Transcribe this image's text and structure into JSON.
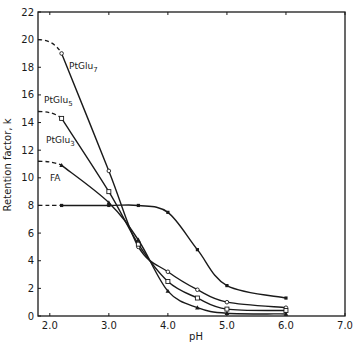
{
  "chart_data": {
    "type": "line",
    "title": "",
    "xlabel": "pH",
    "ylabel": "Retention factor, k",
    "xlim": [
      1.8,
      7.0
    ],
    "ylim": [
      0,
      22
    ],
    "x_ticks": [
      "2.0",
      "3.0",
      "4.0",
      "5.0",
      "6.0",
      "7.0"
    ],
    "y_ticks": [
      "0",
      "2",
      "4",
      "6",
      "8",
      "10",
      "12",
      "14",
      "16",
      "18",
      "20",
      "22"
    ],
    "grid": false,
    "legend": "inline labels",
    "series": [
      {
        "name": "PtGlu7",
        "label_main": "PtGlu",
        "label_sub": "7",
        "marker": "circle",
        "x": [
          2.2,
          3.0,
          3.5,
          4.0,
          4.5,
          5.0,
          6.0
        ],
        "y": [
          19.0,
          10.5,
          5.0,
          3.2,
          1.9,
          1.0,
          0.6
        ],
        "dashed_extrapolation": {
          "x": [
            1.8,
            2.2
          ],
          "y": [
            20.0,
            19.0
          ]
        }
      },
      {
        "name": "PtGlu5",
        "label_main": "PtGlu",
        "label_sub": "5",
        "marker": "square",
        "x": [
          2.2,
          3.0,
          3.5,
          4.0,
          4.5,
          5.0,
          6.0
        ],
        "y": [
          14.3,
          9.0,
          5.2,
          2.5,
          1.3,
          0.5,
          0.4
        ],
        "dashed_extrapolation": {
          "x": [
            1.8,
            2.2
          ],
          "y": [
            14.8,
            14.3
          ]
        }
      },
      {
        "name": "PtGlu3",
        "label_main": "PtGlu",
        "label_sub": "3",
        "marker": "triangle",
        "x": [
          2.2,
          3.0,
          3.5,
          4.0,
          4.5,
          5.0,
          6.0
        ],
        "y": [
          10.9,
          8.2,
          5.5,
          1.8,
          0.6,
          0.2,
          0.15
        ],
        "dashed_extrapolation": {
          "x": [
            1.8,
            2.2
          ],
          "y": [
            11.2,
            10.9
          ]
        }
      },
      {
        "name": "FA",
        "label_main": "FA",
        "label_sub": "",
        "marker": "x",
        "x": [
          2.2,
          3.0,
          3.5,
          4.0,
          4.5,
          5.0,
          6.0
        ],
        "y": [
          8.0,
          8.0,
          8.0,
          7.5,
          4.8,
          2.2,
          1.3
        ],
        "dashed_extrapolation": {
          "x": [
            1.8,
            2.2
          ],
          "y": [
            8.0,
            8.0
          ]
        }
      }
    ]
  }
}
